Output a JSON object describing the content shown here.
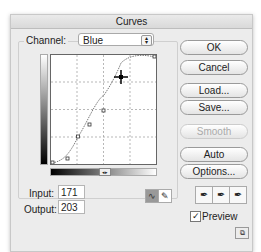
{
  "window": {
    "title": "Curves"
  },
  "channel": {
    "label": "Channel:",
    "value": "Blue"
  },
  "curve": {
    "points": [
      [
        0,
        0
      ],
      [
        28,
        14
      ],
      [
        69,
        38
      ],
      [
        103,
        71
      ],
      [
        171,
        203
      ],
      [
        255,
        255
      ]
    ],
    "selected_point": [
      171,
      203
    ]
  },
  "fields": {
    "input_label": "Input:",
    "input_value": "171",
    "output_label": "Output:",
    "output_value": "203"
  },
  "buttons": {
    "ok": "OK",
    "cancel": "Cancel",
    "load": "Load...",
    "save": "Save...",
    "smooth": "Smooth",
    "auto": "Auto",
    "options": "Options..."
  },
  "preview": {
    "label": "Preview",
    "checked": true
  },
  "icons": {
    "curve_mode": "curve-tool-icon",
    "pencil_mode": "pencil-icon",
    "eyedroppers": [
      "black-eyedropper-icon",
      "gray-eyedropper-icon",
      "white-eyedropper-icon"
    ],
    "expand": "expand-view-icon"
  }
}
